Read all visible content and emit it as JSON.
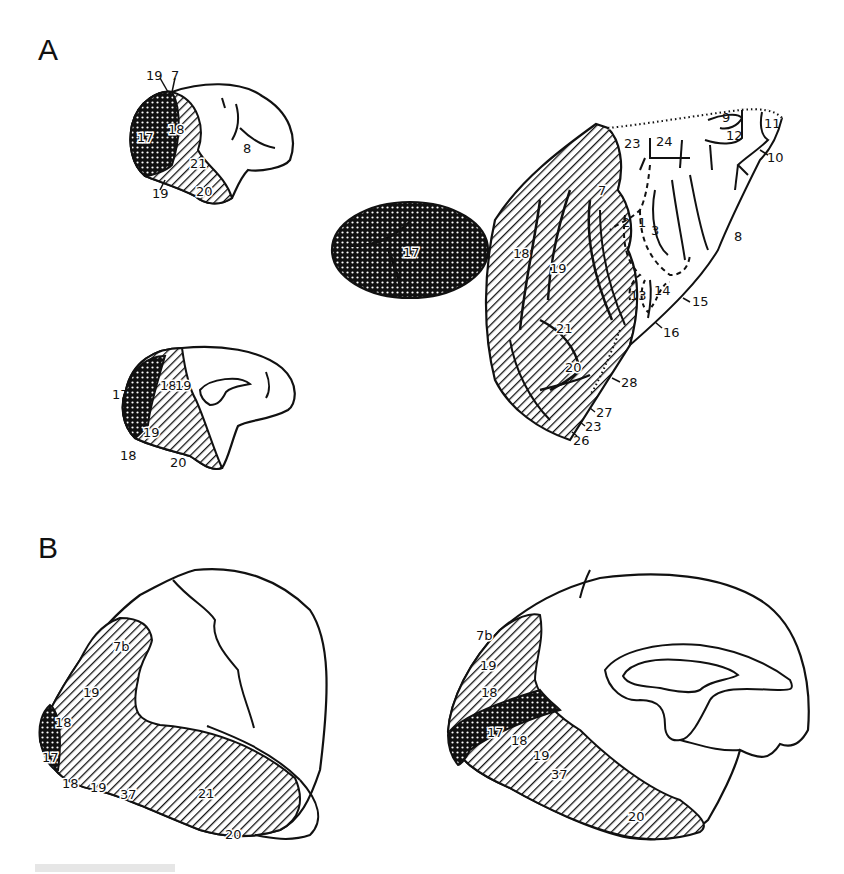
{
  "figure": {
    "panels": [
      {
        "id": "A",
        "label": "A",
        "subfigures": {
          "lateral_small": {
            "labels": {
              "l19a": "19",
              "l7": "7",
              "l17": "17",
              "l18": "18",
              "l8": "8",
              "l21": "21",
              "l19b": "19",
              "l20": "20"
            }
          },
          "medial_small": {
            "labels": {
              "l17": "17",
              "l18a": "18",
              "l19a": "19",
              "l19b": "19",
              "l18b": "18",
              "l20": "20"
            }
          },
          "flatmap": {
            "labels": {
              "l17": "17",
              "l18": "18",
              "l19": "19",
              "l7": "7",
              "l21": "21",
              "l20": "20",
              "l23a": "23",
              "l24": "24",
              "l9": "9",
              "l12": "12",
              "l11": "11",
              "l10": "10",
              "l2": "2",
              "l1": "1",
              "l3": "3",
              "l8": "8",
              "l13": "13",
              "l14": "14",
              "l15": "15",
              "l16": "16",
              "l28": "28",
              "l27": "27",
              "l23b": "23",
              "l26": "26"
            }
          }
        }
      },
      {
        "id": "B",
        "label": "B",
        "subfigures": {
          "lateral_large": {
            "labels": {
              "l7b": "7b",
              "l19a": "19",
              "l18a": "18",
              "l17": "17",
              "l18b": "18",
              "l19b": "19",
              "l37": "37",
              "l21": "21",
              "l20": "20"
            }
          },
          "medial_large": {
            "labels": {
              "l7b": "7b",
              "l19a": "19",
              "l18a": "18",
              "l17": "17",
              "l18b": "18",
              "l19b": "19",
              "l37": "37",
              "l20": "20"
            }
          }
        }
      }
    ],
    "legend_patterns": {
      "area17": "dense dotted (dark)",
      "extrastriate": "diagonal hatching"
    },
    "colors": {
      "ink": "#111111",
      "background": "#ffffff"
    }
  }
}
